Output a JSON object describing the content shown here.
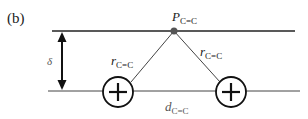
{
  "panel_label": "(b)",
  "labels": {
    "point": {
      "main": "P",
      "sub": "C=C"
    },
    "r_left": {
      "main": "r",
      "sub": "C=C"
    },
    "r_right": {
      "main": "r",
      "sub": "C=C"
    },
    "delta": "δ",
    "distance": {
      "main": "d",
      "sub": "C=C"
    }
  },
  "elements": {
    "top_line": "upper plane",
    "bottom_line": "lower plane",
    "charges": [
      "+",
      "+"
    ]
  },
  "colors": {
    "line": "#222222",
    "point": "#555555",
    "text": "#222222"
  }
}
